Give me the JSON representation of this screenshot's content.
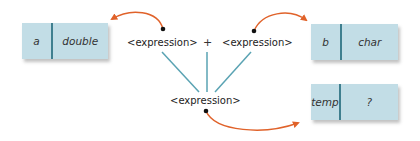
{
  "diagram": {
    "variables": [
      {
        "name": "a",
        "type": "double"
      },
      {
        "name": "b",
        "type": "char"
      },
      {
        "name": "temp",
        "type": "?"
      }
    ],
    "expression": {
      "left": "<expression>",
      "operator": "+",
      "right": "<expression>",
      "result": "<expression>"
    },
    "colors": {
      "box_fill": "#c2dde6",
      "box_divider": "#3f7f8f",
      "tree_lines": "#5aa3b3",
      "arrows": "#e0622a"
    }
  }
}
